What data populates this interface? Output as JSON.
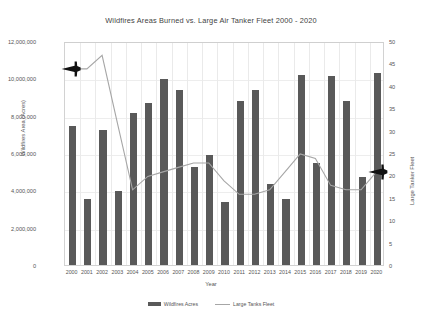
{
  "chart_data": {
    "type": "bar",
    "title": "Wildfires Areas Burned vs. Large Air Tanker Fleet  2000 - 2020",
    "xlabel": "Year",
    "ylabel": "Wildfires Area (Acres)",
    "ylabel_right": "Large Tanker Fleet",
    "grid": true,
    "legend_position": "bottom",
    "categories": [
      "2000",
      "2001",
      "2002",
      "2003",
      "2004",
      "2005",
      "2006",
      "2007",
      "2008",
      "2009",
      "2010",
      "2011",
      "2012",
      "2013",
      "2014",
      "2015",
      "2016",
      "2017",
      "2018",
      "2019",
      "2020"
    ],
    "ylim": [
      0,
      12000000
    ],
    "ylim_right": [
      0,
      50
    ],
    "yticks": [
      "0",
      "2,000,000",
      "4,000,000",
      "6,000,000",
      "8,000,000",
      "10,000,000",
      "12,000,000"
    ],
    "yticks_right": [
      "0",
      "5",
      "10",
      "15",
      "20",
      "25",
      "30",
      "35",
      "40",
      "45",
      "50"
    ],
    "series": [
      {
        "name": "Wildfires Acres",
        "type": "bar",
        "axis": "left",
        "color": "#595959",
        "values": [
          7450000,
          3550000,
          7250000,
          3950000,
          8150000,
          8700000,
          9950000,
          9350000,
          5250000,
          5900000,
          3400000,
          8800000,
          9350000,
          4350000,
          3550000,
          10200000,
          5450000,
          10100000,
          8800000,
          4700000,
          10300000
        ]
      },
      {
        "name": "Large Tanks Fleet",
        "type": "line",
        "axis": "right",
        "color": "#a6a6a6",
        "values": [
          44,
          44,
          47,
          32,
          17,
          20,
          21,
          22,
          23,
          23,
          19,
          16,
          16,
          17,
          21,
          25,
          24,
          18,
          17,
          17,
          21
        ],
        "marker_start_icon": "airplane-icon",
        "marker_end_icon": "airplane-icon"
      }
    ]
  },
  "legend": {
    "items": [
      {
        "label": "Wildfires Acres",
        "swatch": "bar-swatch"
      },
      {
        "label": "Large Tanks Fleet",
        "swatch": "line-swatch"
      }
    ]
  }
}
